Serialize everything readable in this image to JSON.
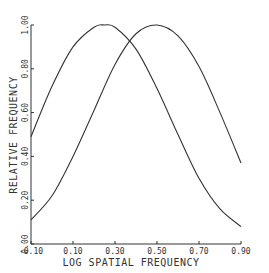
{
  "chart_data": {
    "type": "line",
    "title": "",
    "xlabel": "LOG SPATIAL FREQUENCY",
    "ylabel": "RELATIVE FREQUENCY",
    "xlim": [
      -0.1,
      0.9
    ],
    "ylim": [
      0.0,
      1.0
    ],
    "x_ticks": [
      "-0.10",
      "0.10",
      "0.30",
      "0.50",
      "0.70",
      "0.90"
    ],
    "y_ticks": [
      "0.00",
      "0.20",
      "0.40",
      "0.60",
      "0.80",
      "1.00"
    ],
    "grid": false,
    "legend": null,
    "series": [
      {
        "name": "curve-left",
        "x": [
          -0.1,
          0.0,
          0.1,
          0.2,
          0.25,
          0.3,
          0.4,
          0.5,
          0.6,
          0.7,
          0.8,
          0.9
        ],
        "y": [
          0.49,
          0.72,
          0.9,
          0.99,
          1.0,
          0.99,
          0.89,
          0.71,
          0.5,
          0.3,
          0.16,
          0.08
        ]
      },
      {
        "name": "curve-right",
        "x": [
          -0.1,
          0.0,
          0.1,
          0.2,
          0.3,
          0.4,
          0.5,
          0.6,
          0.7,
          0.8,
          0.9
        ],
        "y": [
          0.11,
          0.22,
          0.4,
          0.61,
          0.82,
          0.96,
          1.0,
          0.95,
          0.81,
          0.6,
          0.37
        ]
      }
    ]
  },
  "axes": {
    "x_title": "LOG SPATIAL FREQUENCY",
    "y_title": "RELATIVE FREQUENCY",
    "x_ticks": [
      "-0.10",
      "0.10",
      "0.30",
      "0.50",
      "0.70",
      "0.90"
    ],
    "y_ticks": [
      "0.00",
      "0.20",
      "0.40",
      "0.60",
      "0.80",
      "1.00"
    ]
  },
  "colors": {
    "line": "#333333",
    "background": "#ffffff"
  }
}
